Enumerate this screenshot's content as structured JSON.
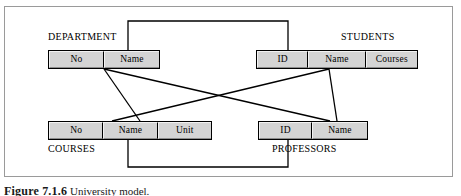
{
  "figure": {
    "caption_label": "Figure 7.1.6",
    "caption_text": "University model.",
    "frame_color": "#9a9a9a",
    "cell_fill_color": "#d4d4d4",
    "line_color": "#000000"
  },
  "entities": [
    {
      "name": "DEPARTMENT",
      "caption": "DEPARTMENT",
      "caption_position": "above-left",
      "attributes": [
        {
          "label": "No"
        },
        {
          "label": "Name"
        }
      ]
    },
    {
      "name": "STUDENTS",
      "caption": "STUDENTS",
      "caption_position": "above-right",
      "attributes": [
        {
          "label": "ID"
        },
        {
          "label": "Name"
        },
        {
          "label": "Courses"
        }
      ]
    },
    {
      "name": "COURSES",
      "caption": "COURSES",
      "caption_position": "below-left",
      "attributes": [
        {
          "label": "No"
        },
        {
          "label": "Name"
        },
        {
          "label": "Unit"
        }
      ]
    },
    {
      "name": "PROFESSORS",
      "caption": "PROFESSORS",
      "caption_position": "below-right",
      "attributes": [
        {
          "label": "ID"
        },
        {
          "label": "Name"
        }
      ]
    }
  ],
  "relationships": [
    {
      "from": "DEPARTMENT.Name",
      "to": "STUDENTS.ID",
      "style": "orthogonal-top"
    },
    {
      "from": "DEPARTMENT.Name",
      "to": "COURSES.Name",
      "style": "diagonal"
    },
    {
      "from": "DEPARTMENT.Name",
      "to": "PROFESSORS.Name",
      "style": "diagonal"
    },
    {
      "from": "STUDENTS.Name",
      "to": "COURSES.Name",
      "style": "diagonal"
    },
    {
      "from": "STUDENTS.Name",
      "to": "PROFESSORS.Name",
      "style": "diagonal"
    },
    {
      "from": "COURSES.Name",
      "to": "PROFESSORS.ID",
      "style": "orthogonal-bottom"
    }
  ]
}
